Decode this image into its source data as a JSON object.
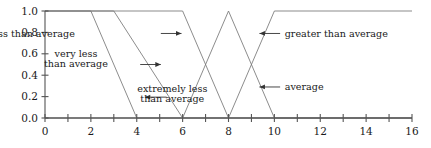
{
  "chart_data": {
    "type": "line",
    "title": "",
    "subtitle": "",
    "xlabel": "",
    "ylabel": "",
    "xlim": [
      0,
      16
    ],
    "ylim": [
      0.0,
      1.0
    ],
    "grid": false,
    "legend_position": "none",
    "x_ticks": [
      0,
      1,
      2,
      3,
      4,
      5,
      6,
      7,
      8,
      9,
      10,
      11,
      12,
      13,
      14,
      15,
      16
    ],
    "x_tick_labels": [
      "0",
      "",
      "2",
      "",
      "4",
      "",
      "6",
      "",
      "8",
      "",
      "10",
      "",
      "12",
      "",
      "14",
      "",
      "16"
    ],
    "y_ticks": [
      0.0,
      0.2,
      0.4,
      0.6,
      0.8,
      1.0
    ],
    "y_tick_labels": [
      "0.0",
      "0.2",
      "0.4",
      "0.6",
      "0.8",
      "1.0"
    ],
    "series": [
      {
        "name": "extremely less than average",
        "points": [
          [
            0,
            1.0
          ],
          [
            2,
            1.0
          ],
          [
            4,
            0.0
          ],
          [
            16,
            0.0
          ]
        ]
      },
      {
        "name": "very less than average",
        "points": [
          [
            0,
            1.0
          ],
          [
            3,
            1.0
          ],
          [
            6,
            0.0
          ],
          [
            16,
            0.0
          ]
        ]
      },
      {
        "name": "less than average",
        "points": [
          [
            0,
            1.0
          ],
          [
            6,
            1.0
          ],
          [
            8,
            0.0
          ],
          [
            16,
            0.0
          ]
        ]
      },
      {
        "name": "average",
        "points": [
          [
            0,
            0.0
          ],
          [
            6,
            0.0
          ],
          [
            8,
            1.0
          ],
          [
            10,
            0.0
          ],
          [
            16,
            0.0
          ]
        ]
      },
      {
        "name": "greater than average",
        "points": [
          [
            0,
            0.0
          ],
          [
            8,
            0.0
          ],
          [
            10,
            1.0
          ],
          [
            16,
            1.0
          ]
        ]
      }
    ],
    "annotations": [
      {
        "id": "less-than-average",
        "text": "less than average",
        "lines": [
          "less than average"
        ],
        "arrow_direction": "right",
        "label_x": 1.3,
        "label_y": 0.79,
        "arrow_from_x": 5.05,
        "arrow_to_x": 5.95,
        "arrow_y": 0.79
      },
      {
        "id": "very-less-than-average",
        "text": "very less than average",
        "lines": [
          "very less",
          "than average"
        ],
        "arrow_direction": "right",
        "label_x": 1.35,
        "label_y": 0.555,
        "arrow_from_x": 4.15,
        "arrow_to_x": 5.05,
        "arrow_y": 0.5
      },
      {
        "id": "extremely-less-than-average",
        "text": "extremely less than average",
        "lines": [
          "extremely less",
          "than average"
        ],
        "arrow_direction": "left",
        "label_x": 5.55,
        "label_y": 0.225,
        "arrow_from_x": 5.3,
        "arrow_to_x": 4.35,
        "arrow_y": 0.195
      },
      {
        "id": "greater-than-average",
        "text": "greater than average",
        "lines": [
          "greater than average"
        ],
        "arrow_direction": "left",
        "label_x": 10.45,
        "label_y": 0.79,
        "arrow_from_x": 10.25,
        "arrow_to_x": 9.35,
        "arrow_y": 0.79
      },
      {
        "id": "average",
        "text": "average",
        "lines": [
          "average"
        ],
        "arrow_direction": "left",
        "label_x": 10.45,
        "label_y": 0.29,
        "arrow_from_x": 10.25,
        "arrow_to_x": 9.35,
        "arrow_y": 0.29
      }
    ]
  },
  "colors": {
    "axis": "#555555",
    "curve": "#777777",
    "annotation": "#333333",
    "text": "#1a1a1a",
    "background": "#ffffff"
  }
}
